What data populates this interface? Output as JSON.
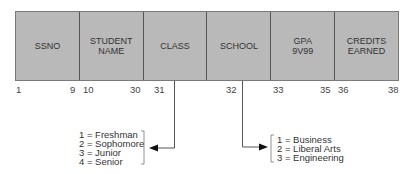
{
  "record": {
    "fields": [
      {
        "label": "SSNO",
        "start": "1",
        "end": "9"
      },
      {
        "label": "STUDENT\nNAME",
        "start": "10",
        "end": "30"
      },
      {
        "label": "CLASS",
        "start": "31",
        "end": ""
      },
      {
        "label": "SCHOOL",
        "start": "",
        "end": "32"
      },
      {
        "label": "GPA\n9V99",
        "start": "33",
        "end": "35"
      },
      {
        "label": "CREDITS\nEARNED",
        "start": "36",
        "end": "38"
      }
    ]
  },
  "class_codes": "1 = Freshman\n2 = Sophomore\n3 = Junior\n4 = Senior",
  "school_codes": "1 = Business\n2 = Liberal Arts\n3 = Engineering",
  "colors": {
    "cell_fill": "#b9b9b9",
    "line": "#555555"
  }
}
